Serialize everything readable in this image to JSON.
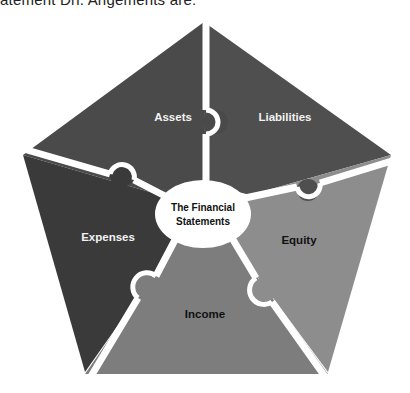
{
  "caption": "atement Drl. Angements are:",
  "diagram": {
    "center_label_line1": "The Financial",
    "center_label_line2": "Statements",
    "pieces": [
      {
        "label": "Assets",
        "color": "#4a4a4a"
      },
      {
        "label": "Liabilities",
        "color": "#4f4f4f"
      },
      {
        "label": "Equity",
        "color": "#8d8d8d"
      },
      {
        "label": "Income",
        "color": "#7d7d7d"
      },
      {
        "label": "Expenses",
        "color": "#3a3a3a"
      }
    ],
    "separator_color": "#ffffff",
    "center_color": "#ffffff"
  }
}
